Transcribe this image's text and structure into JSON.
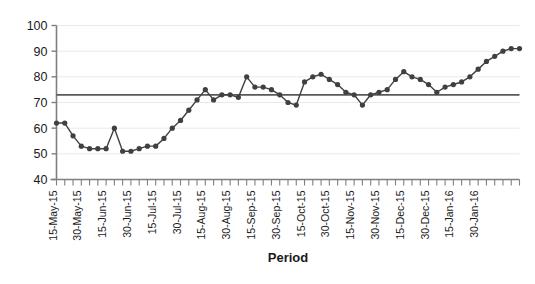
{
  "chart_data": {
    "type": "line",
    "title": "",
    "xlabel": "Period",
    "ylabel": "",
    "ylim": [
      40,
      100
    ],
    "ytick_step": 10,
    "yticks": [
      40,
      50,
      60,
      70,
      80,
      90,
      100
    ],
    "grid": true,
    "legend_position": "none",
    "x_tick_labels": [
      "15-May-15",
      "30-May-15",
      "15-Jun-15",
      "30-Jun-15",
      "15-Jul-15",
      "30-Jul-15",
      "15-Aug-15",
      "30-Aug-15",
      "15-Sep-15",
      "30-Sep-15",
      "15-Oct-15",
      "30-Oct-15",
      "15-Nov-15",
      "30-Nov-15",
      "15-Dec-15",
      "30-Dec-15",
      "15-Jan-16",
      "30-Jan-16"
    ],
    "x_label_every": 3,
    "reference_line": {
      "label": "",
      "value": 73,
      "color": "#595959"
    },
    "series": [
      {
        "name": "Value",
        "color": "#404040",
        "marker": "circle",
        "values": [
          62,
          62,
          57,
          53,
          52,
          52,
          52,
          60,
          51,
          51,
          52,
          53,
          53,
          56,
          60,
          63,
          67,
          71,
          75,
          71,
          73,
          73,
          72,
          80,
          76,
          76,
          75,
          73,
          70,
          69,
          78,
          80,
          81,
          79,
          77,
          74,
          73,
          69,
          73,
          74,
          75,
          79,
          82,
          80,
          79,
          77,
          74,
          76,
          77,
          78,
          80,
          83,
          86,
          88,
          90,
          91,
          91
        ]
      }
    ]
  },
  "axis": {
    "x_title": "Period"
  },
  "colors": {
    "series": "#404040",
    "reference_line": "#595959",
    "gridline": "#e9e9e9",
    "axis": "#7f7f7f",
    "text": "#1a1a1a",
    "background": "#ffffff"
  }
}
